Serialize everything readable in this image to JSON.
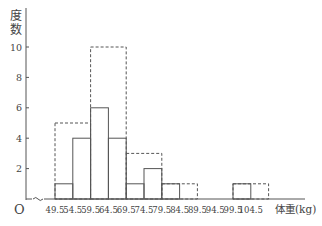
{
  "chart_data": {
    "type": "bar",
    "title": "",
    "caption": "図 … 体重 … (partially visible)",
    "xlabel": "体重(kg)",
    "ylabel": "度数",
    "origin_label": "O",
    "ylim": [
      0,
      11
    ],
    "yticks": [
      2,
      4,
      6,
      8,
      10
    ],
    "xticks": [
      "49.5",
      "54.5",
      "59.5",
      "64.5",
      "69.5",
      "74.5",
      "79.5",
      "84.5",
      "89.5",
      "94.5",
      "99.5",
      "104.5"
    ],
    "grid": false,
    "series": [
      {
        "name": "class width 5kg (solid)",
        "style": "solid",
        "bins": [
          {
            "from": 49.5,
            "to": 54.5,
            "value": 1
          },
          {
            "from": 54.5,
            "to": 59.5,
            "value": 4
          },
          {
            "from": 59.5,
            "to": 64.5,
            "value": 6
          },
          {
            "from": 64.5,
            "to": 69.5,
            "value": 4
          },
          {
            "from": 69.5,
            "to": 74.5,
            "value": 1
          },
          {
            "from": 74.5,
            "to": 79.5,
            "value": 2
          },
          {
            "from": 79.5,
            "to": 84.5,
            "value": 1
          },
          {
            "from": 84.5,
            "to": 89.5,
            "value": 0
          },
          {
            "from": 89.5,
            "to": 94.5,
            "value": 0
          },
          {
            "from": 94.5,
            "to": 99.5,
            "value": 0
          },
          {
            "from": 99.5,
            "to": 104.5,
            "value": 1
          }
        ]
      },
      {
        "name": "class width 10kg (dashed)",
        "style": "dashed",
        "bins": [
          {
            "from": 49.5,
            "to": 59.5,
            "value": 5
          },
          {
            "from": 59.5,
            "to": 69.5,
            "value": 10
          },
          {
            "from": 69.5,
            "to": 79.5,
            "value": 3
          },
          {
            "from": 79.5,
            "to": 89.5,
            "value": 1
          },
          {
            "from": 89.5,
            "to": 99.5,
            "value": 0
          },
          {
            "from": 99.5,
            "to": 109.5,
            "value": 1
          }
        ]
      }
    ]
  },
  "colors": {
    "line": "#555555",
    "text": "#444444"
  }
}
